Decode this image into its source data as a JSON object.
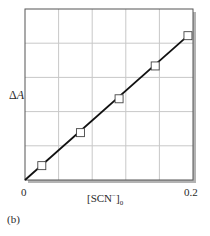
{
  "figure": {
    "panel_label": "(b)",
    "y_axis": {
      "label_symbol": "Δ",
      "label_var": "A"
    },
    "x_axis": {
      "label_main": "[SCN",
      "label_sup": "−",
      "label_close": "]",
      "label_sub": "0",
      "tick_min": "0",
      "tick_max": "0.2"
    }
  },
  "chart_data": {
    "type": "scatter",
    "title": "",
    "xlabel": "[SCN⁻]₀",
    "ylabel": "ΔA",
    "xlim": [
      0,
      0.2
    ],
    "ylim": [
      0,
      1
    ],
    "x_ticks": [
      "0",
      "0.2"
    ],
    "y_ticks": [],
    "grid": true,
    "grid_divisions": {
      "x": 5,
      "y": 5
    },
    "legend": null,
    "series": [
      {
        "name": "measured",
        "marker": "open-square",
        "x": [
          0.02,
          0.066,
          0.112,
          0.155,
          0.194
        ],
        "y": [
          0.084,
          0.277,
          0.475,
          0.667,
          0.844
        ]
      },
      {
        "name": "linear fit",
        "style": "solid-line",
        "x": [
          0.0,
          0.194
        ],
        "y": [
          0.0,
          0.844
        ]
      }
    ],
    "annotations": [
      "(b)"
    ],
    "colors": {
      "axis": "#555555",
      "grid": "#c8c8c8",
      "line": "#111111",
      "marker_fill": "#ffffff",
      "marker_edge": "#444444",
      "shadow": "#9a9a9a"
    }
  }
}
